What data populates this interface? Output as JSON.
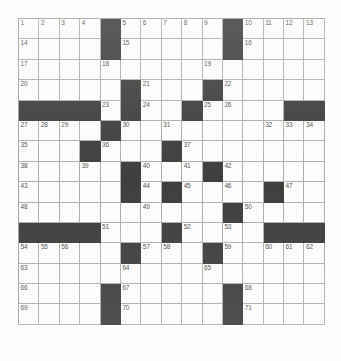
{
  "puzzle": {
    "type": "crossword-grid",
    "rows": 15,
    "columns": 15,
    "cell_size_px": 20.4,
    "colors": {
      "block": "#0b0b0b",
      "open_cell": "#fdfdfd",
      "grid_line": "#9a9a9a",
      "number_text": "#1a1a1a",
      "page_background": "#ffffff"
    },
    "max_clue_number": 71,
    "filled_letters": false,
    "grid": [
      [
        "1",
        "2",
        "3",
        "4",
        "#",
        "5",
        "6",
        "7",
        "8",
        "9",
        "#",
        "10",
        "11",
        "12",
        "13"
      ],
      [
        "14",
        "",
        "",
        "",
        "#",
        "15",
        "",
        "",
        "",
        "",
        "#",
        "16",
        "",
        "",
        ""
      ],
      [
        "17",
        "",
        "",
        "",
        "18",
        "",
        "",
        "",
        "",
        "19",
        "",
        "",
        "",
        "",
        ""
      ],
      [
        "20",
        "",
        "",
        "",
        "",
        "#",
        "21",
        "",
        "",
        "#",
        "22",
        "",
        "",
        "",
        ""
      ],
      [
        "#",
        "#",
        "#",
        "#",
        "23",
        "#",
        "24",
        "",
        "#",
        "25",
        "26",
        "",
        "",
        "#",
        "#"
      ],
      [
        "27",
        "28",
        "29",
        "",
        "#",
        "30",
        "",
        "31",
        "",
        "",
        "",
        "",
        "32",
        "33",
        "34"
      ],
      [
        "35",
        "",
        "",
        "#",
        "36",
        "",
        "",
        "#",
        "37",
        "",
        "",
        "",
        "",
        "",
        ""
      ],
      [
        "38",
        "",
        "",
        "39",
        "",
        "#",
        "40",
        "",
        "41",
        "#",
        "42",
        "",
        "",
        "",
        ""
      ],
      [
        "43",
        "",
        "",
        "",
        "",
        "#",
        "44",
        "#",
        "45",
        "",
        "46",
        "",
        "#",
        "47",
        ""
      ],
      [
        "48",
        "",
        "",
        "",
        "",
        "",
        "49",
        "",
        "",
        "",
        "#",
        "50",
        "",
        "",
        ""
      ],
      [
        "#",
        "#",
        "#",
        "#",
        "51",
        "",
        "",
        "#",
        "52",
        "",
        "53",
        "",
        "#",
        "#",
        "#"
      ],
      [
        "54",
        "55",
        "56",
        "",
        "",
        "#",
        "57",
        "58",
        "",
        "#",
        "59",
        "",
        "60",
        "61",
        "62"
      ],
      [
        "63",
        "",
        "",
        "",
        "",
        "64",
        "",
        "",
        "",
        "65",
        "",
        "",
        "",
        "",
        ""
      ],
      [
        "66",
        "",
        "",
        "",
        "#",
        "67",
        "",
        "",
        "",
        "",
        "#",
        "68",
        "",
        "",
        ""
      ],
      [
        "69",
        "",
        "",
        "",
        "#",
        "70",
        "",
        "",
        "",
        "",
        "#",
        "71",
        "",
        "",
        ""
      ]
    ]
  }
}
